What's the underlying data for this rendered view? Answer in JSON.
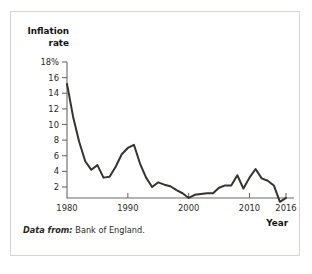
{
  "figure": {
    "source_note_lead": "Data from:",
    "source_note_body": "Bank of England.",
    "frame_color": "#d8d5d0",
    "line_color": "#35322f",
    "axis_color": "#6d6a66"
  },
  "chart_data": {
    "type": "line",
    "title": "",
    "xlabel": "Year",
    "ylabel": "Inflation rate",
    "ylabel_lines": [
      "Inflation",
      "rate"
    ],
    "grid": false,
    "legend": "none",
    "xlim": [
      1980,
      2016
    ],
    "ylim": [
      0,
      18
    ],
    "ytick_labels": [
      "18%",
      "16",
      "14",
      "12",
      "10",
      "8",
      "6",
      "4",
      "2"
    ],
    "yticks": [
      18,
      16,
      14,
      12,
      10,
      8,
      6,
      4,
      2
    ],
    "xtick_labels": [
      "1980",
      "1990",
      "2000",
      "2010",
      "2016"
    ],
    "xticks": [
      1980,
      1990,
      2000,
      2010,
      2016
    ],
    "series": [
      {
        "name": "UK inflation rate",
        "x": [
          1980,
          1981,
          1982,
          1983,
          1984,
          1985,
          1986,
          1987,
          1988,
          1989,
          1990,
          1991,
          1992,
          1993,
          1994,
          1995,
          1996,
          1997,
          1998,
          1999,
          2000,
          2001,
          2002,
          2003,
          2004,
          2005,
          2006,
          2007,
          2008,
          2009,
          2010,
          2011,
          2012,
          2013,
          2014,
          2015,
          2016
        ],
        "values": [
          15.2,
          11.0,
          7.8,
          5.3,
          4.2,
          4.8,
          3.2,
          3.3,
          4.6,
          6.2,
          7.0,
          7.4,
          5.0,
          3.2,
          2.0,
          2.6,
          2.3,
          2.1,
          1.6,
          1.2,
          0.6,
          1.0,
          1.1,
          1.2,
          1.2,
          1.9,
          2.2,
          2.2,
          3.5,
          1.8,
          3.2,
          4.3,
          3.1,
          2.8,
          2.2,
          0.1,
          0.6
        ]
      }
    ]
  }
}
